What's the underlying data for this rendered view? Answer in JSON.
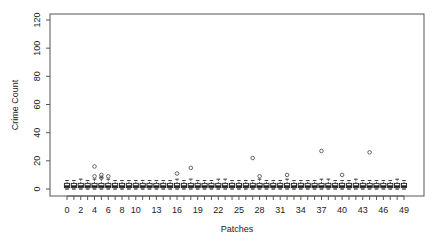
{
  "chart_data": {
    "type": "boxplot",
    "title": "",
    "xlabel": "Patches",
    "ylabel": "Crime Count",
    "ylim": [
      0,
      120
    ],
    "yticks": [
      0,
      20,
      40,
      60,
      80,
      100,
      120
    ],
    "categories": [
      "0",
      "1",
      "2",
      "3",
      "4",
      "5",
      "6",
      "7",
      "8",
      "9",
      "10",
      "11",
      "12",
      "13",
      "14",
      "15",
      "16",
      "17",
      "18",
      "19",
      "20",
      "21",
      "22",
      "23",
      "24",
      "25",
      "26",
      "27",
      "28",
      "29",
      "30",
      "31",
      "32",
      "33",
      "34",
      "35",
      "36",
      "37",
      "38",
      "39",
      "40",
      "41",
      "42",
      "43",
      "44",
      "45",
      "46",
      "47",
      "48",
      "49"
    ],
    "xtick_labels_shown": [
      "0",
      "2",
      "4",
      "6",
      "8",
      "10",
      "13",
      "16",
      "19",
      "22",
      "25",
      "28",
      "31",
      "34",
      "37",
      "40",
      "43",
      "46",
      "49"
    ],
    "grid": false,
    "box_stats_approx": {
      "q1": 1,
      "median": 2,
      "q3": 4,
      "whisker_low": 0,
      "whisker_high": 6
    },
    "box_whisker_high_by_patch": [
      6,
      6,
      7,
      6,
      7,
      8,
      7,
      6,
      6,
      6,
      6,
      6,
      6,
      6,
      6,
      6,
      7,
      6,
      7,
      6,
      6,
      6,
      7,
      7,
      6,
      6,
      6,
      6,
      7,
      6,
      6,
      6,
      7,
      6,
      6,
      6,
      6,
      7,
      7,
      6,
      6,
      6,
      7,
      6,
      6,
      6,
      6,
      6,
      7,
      6
    ],
    "outliers": [
      {
        "patch": 4,
        "value": 16
      },
      {
        "patch": 4,
        "value": 9
      },
      {
        "patch": 5,
        "value": 10
      },
      {
        "patch": 5,
        "value": 8
      },
      {
        "patch": 6,
        "value": 9
      },
      {
        "patch": 16,
        "value": 11
      },
      {
        "patch": 18,
        "value": 15
      },
      {
        "patch": 27,
        "value": 22
      },
      {
        "patch": 28,
        "value": 9
      },
      {
        "patch": 32,
        "value": 10
      },
      {
        "patch": 37,
        "value": 27
      },
      {
        "patch": 40,
        "value": 10
      },
      {
        "patch": 44,
        "value": 26
      }
    ]
  },
  "colors": {
    "frame": "#555555",
    "box": "#222222",
    "outlier": "#444444",
    "text": "#222222"
  }
}
